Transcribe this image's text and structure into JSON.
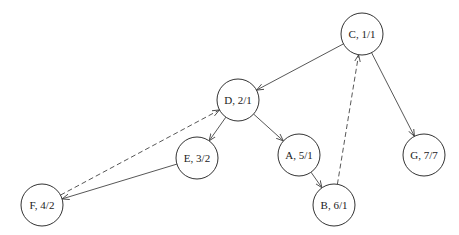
{
  "diagram": {
    "type": "directed-graph",
    "nodes": [
      {
        "id": "C",
        "label": "C, 1/1",
        "x": 362,
        "y": 34
      },
      {
        "id": "D",
        "label": "D, 2/1",
        "x": 238,
        "y": 100
      },
      {
        "id": "G",
        "label": "G, 7/7",
        "x": 424,
        "y": 155
      },
      {
        "id": "E",
        "label": "E, 3/2",
        "x": 197,
        "y": 158
      },
      {
        "id": "A",
        "label": "A, 5/1",
        "x": 299,
        "y": 155
      },
      {
        "id": "F",
        "label": "F, 4/2",
        "x": 42,
        "y": 205
      },
      {
        "id": "B",
        "label": "B, 6/1",
        "x": 334,
        "y": 205
      }
    ],
    "edges": [
      {
        "from": "C",
        "to": "D",
        "style": "solid"
      },
      {
        "from": "C",
        "to": "G",
        "style": "solid"
      },
      {
        "from": "D",
        "to": "E",
        "style": "solid"
      },
      {
        "from": "D",
        "to": "A",
        "style": "solid"
      },
      {
        "from": "E",
        "to": "F",
        "style": "solid"
      },
      {
        "from": "A",
        "to": "B",
        "style": "solid"
      },
      {
        "from": "F",
        "to": "D",
        "style": "dashed"
      },
      {
        "from": "B",
        "to": "C",
        "style": "dashed"
      }
    ]
  }
}
